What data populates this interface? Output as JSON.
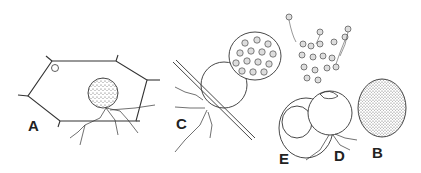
{
  "figure": {
    "type": "scientific line illustration",
    "panels": [
      {
        "id": "A",
        "label": "A",
        "description": "host cell with attached spherical sporangium and branching rhizoids; small encysted zoospore in corner"
      },
      {
        "id": "B",
        "label": "B",
        "description": "stippled resting body / sporangium"
      },
      {
        "id": "C",
        "label": "C",
        "description": "empty sporangium on filament with attached mass of spores and rhizoids"
      },
      {
        "id": "D",
        "label": "D",
        "description": "sporangium releasing flagellated zoospores through apical opening, with rhizoids"
      },
      {
        "id": "E",
        "label": "E",
        "description": "thick-walled resting spore with inner body"
      }
    ]
  },
  "labels": {
    "a": "A",
    "b": "B",
    "c": "C",
    "d": "D",
    "e": "E"
  },
  "colors": {
    "ink": "#333333",
    "background": "#ffffff"
  }
}
